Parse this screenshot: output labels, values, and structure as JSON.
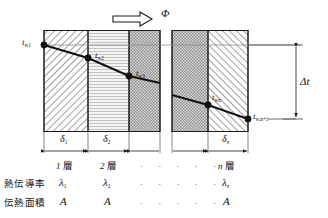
{
  "figure": {
    "heat_flow": {
      "symbol": "Φ",
      "arrow_direction": "right",
      "arrow_name": "heat-flow-arrow"
    },
    "temperature_nodes": [
      {
        "id": "tw1",
        "base": "t",
        "sub": "w1",
        "label_side": "left"
      },
      {
        "id": "tw2",
        "base": "t",
        "sub": "w2",
        "label_side": "right"
      },
      {
        "id": "tw3",
        "base": "t",
        "sub": "w3",
        "label_side": "right"
      },
      {
        "id": "twn",
        "base": "t",
        "sub": "wn",
        "label_side": "right"
      },
      {
        "id": "twn1",
        "base": "t",
        "sub": "w,n+1",
        "label_side": "right"
      }
    ],
    "delta_t": {
      "base": "Δt",
      "name": "delta-t-dimension"
    },
    "thickness_labels": [
      {
        "base": "δ",
        "sub": "1"
      },
      {
        "base": "δ",
        "sub": "2"
      },
      {
        "base": "δ",
        "sub": "n"
      }
    ],
    "layer_labels": [
      {
        "num": "1",
        "unit": "層"
      },
      {
        "num": "2",
        "unit": "層"
      },
      {
        "num": "n",
        "unit": "層"
      }
    ],
    "ellipsis": "·  ·  ·  ·  ·",
    "rows": [
      {
        "name": "thermal-conductivity",
        "row_label": "熱伝導率",
        "values": [
          {
            "base": "λ",
            "sub": "1"
          },
          {
            "base": "λ",
            "sub": "2"
          },
          {
            "base": "λ",
            "sub": "n"
          }
        ]
      },
      {
        "name": "heat-transfer-area",
        "row_label": "伝熱面積",
        "values": [
          {
            "base": "A",
            "sub": ""
          },
          {
            "base": "A",
            "sub": ""
          },
          {
            "base": "A",
            "sub": ""
          }
        ]
      }
    ],
    "colors": {
      "line": "#1a1a1a",
      "hatch": "#4a4a4a",
      "layer2_fill": "#f0f0f0",
      "layer3_fill": "#c9c9c9",
      "thin_rule": "#8a8a8a"
    }
  }
}
